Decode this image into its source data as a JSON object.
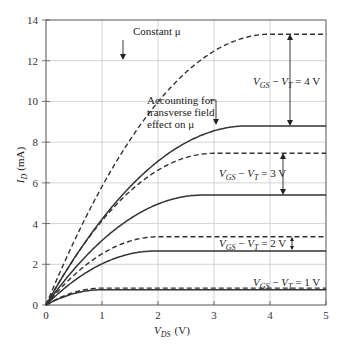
{
  "chart_data": {
    "type": "line",
    "title": "",
    "xlabel": "V_DS (V)",
    "ylabel": "I_D (mA)",
    "xlim": [
      0,
      5
    ],
    "ylim": [
      0,
      14
    ],
    "xticks": [
      0,
      1,
      2,
      3,
      4,
      5
    ],
    "yticks": [
      0,
      2,
      4,
      6,
      8,
      10,
      12,
      14
    ],
    "grid": true,
    "series": [
      {
        "name": "Constant mu, VGS-VT=4V",
        "style": "dashed",
        "vov": 4,
        "isat": 13.3,
        "vdsat": 4.0
      },
      {
        "name": "Transverse field effect, VGS-VT=4V",
        "style": "solid",
        "vov": 4,
        "isat": 8.8,
        "vdsat": 3.6
      },
      {
        "name": "Constant mu, VGS-VT=3V",
        "style": "dashed",
        "vov": 3,
        "isat": 7.45,
        "vdsat": 3.0
      },
      {
        "name": "Transverse field effect, VGS-VT=3V",
        "style": "solid",
        "vov": 3,
        "isat": 5.4,
        "vdsat": 2.8
      },
      {
        "name": "Constant mu, VGS-VT=2V",
        "style": "dashed",
        "vov": 2,
        "isat": 3.35,
        "vdsat": 2.0
      },
      {
        "name": "Transverse field effect, VGS-VT=2V",
        "style": "solid",
        "vov": 2,
        "isat": 2.65,
        "vdsat": 1.95
      },
      {
        "name": "Constant mu, VGS-VT=1V",
        "style": "dashed",
        "vov": 1,
        "isat": 0.83,
        "vdsat": 1.0
      },
      {
        "name": "Transverse field effect, VGS-VT=1V",
        "style": "solid",
        "vov": 1,
        "isat": 0.75,
        "vdsat": 1.0
      }
    ],
    "annotations": [
      {
        "text": "Constant μ",
        "x": 2.15,
        "y": 13.2
      },
      {
        "text": "Accounting for",
        "x": 1.65,
        "y": 9.7
      },
      {
        "text": "transverse field",
        "x": 1.65,
        "y": 9.15
      },
      {
        "text": "effect on μ",
        "x": 1.65,
        "y": 8.6
      },
      {
        "text": "VGS − VT = 4 V",
        "x": 3.65,
        "y": 10.75
      },
      {
        "text": "VGS − VT = 3 V",
        "x": 3.05,
        "y": 6.35
      },
      {
        "text": "VGS − VT = 2 V",
        "x": 3.05,
        "y": 3.0
      },
      {
        "text": "VGS − VT = 1 V",
        "x": 3.65,
        "y": 1.2
      }
    ]
  },
  "labels": {
    "x_axis": "V",
    "x_axis_sub": "DS",
    "x_axis_unit": "(V)",
    "y_axis": "I",
    "y_axis_sub": "D",
    "y_axis_unit": "(mA)",
    "constant_mu": "Constant μ",
    "transverse_1": "Accounting for",
    "transverse_2": "transverse field",
    "transverse_3": "effect on μ",
    "vgs": "V",
    "vgs_sub": "GS",
    "minus": " − ",
    "vt": "V",
    "vt_sub": "T",
    "eq4": " = 4 V",
    "eq3": " = 3 V",
    "eq2": " = 2 V",
    "eq1": " = 1 V"
  }
}
